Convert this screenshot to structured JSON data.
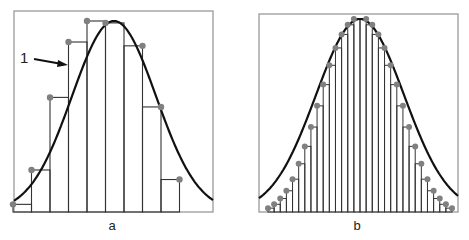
{
  "figure": {
    "panels": [
      {
        "id": "a",
        "label": "a"
      },
      {
        "id": "b",
        "label": "b"
      }
    ],
    "callout": {
      "label": "1",
      "target": "curve"
    }
  },
  "colors": {
    "frame": "#9a9a9a",
    "bar_stroke": "#333333",
    "curve": "#111111",
    "dot": "#808080",
    "background": "#ffffff"
  },
  "chart_data": [
    {
      "type": "bar",
      "title": "a",
      "description": "Histogram with 10 wide bars approximating a bell-shaped curve (1); dots mark where bar's left corner touches the curve",
      "bar_count": 10,
      "categories": [
        1,
        2,
        3,
        4,
        5,
        6,
        7,
        8,
        9,
        10
      ],
      "values": [
        0.04,
        0.22,
        0.6,
        0.89,
        1.0,
        0.99,
        0.87,
        0.55,
        0.17,
        0.0
      ],
      "curve": {
        "type": "normal",
        "mean_fraction": 0.5,
        "peak": 1.0
      },
      "xlabel": "",
      "ylabel": "",
      "grid": false
    },
    {
      "type": "bar",
      "title": "b",
      "description": "Histogram with ~30 narrow bars closely approximating the same bell-shaped curve",
      "bar_count": 30,
      "categories": [
        1,
        2,
        3,
        4,
        5,
        6,
        7,
        8,
        9,
        10,
        11,
        12,
        13,
        14,
        15,
        16,
        17,
        18,
        19,
        20,
        21,
        22,
        23,
        24,
        25,
        26,
        27,
        28,
        29,
        30
      ],
      "values": [
        0.02,
        0.04,
        0.07,
        0.11,
        0.17,
        0.25,
        0.34,
        0.44,
        0.55,
        0.66,
        0.76,
        0.85,
        0.92,
        0.97,
        1.0,
        1.0,
        0.97,
        0.92,
        0.85,
        0.76,
        0.66,
        0.55,
        0.44,
        0.34,
        0.25,
        0.17,
        0.11,
        0.07,
        0.04,
        0.02
      ],
      "curve": {
        "type": "normal",
        "mean_fraction": 0.5,
        "peak": 1.0
      },
      "xlabel": "",
      "ylabel": "",
      "grid": false
    }
  ]
}
